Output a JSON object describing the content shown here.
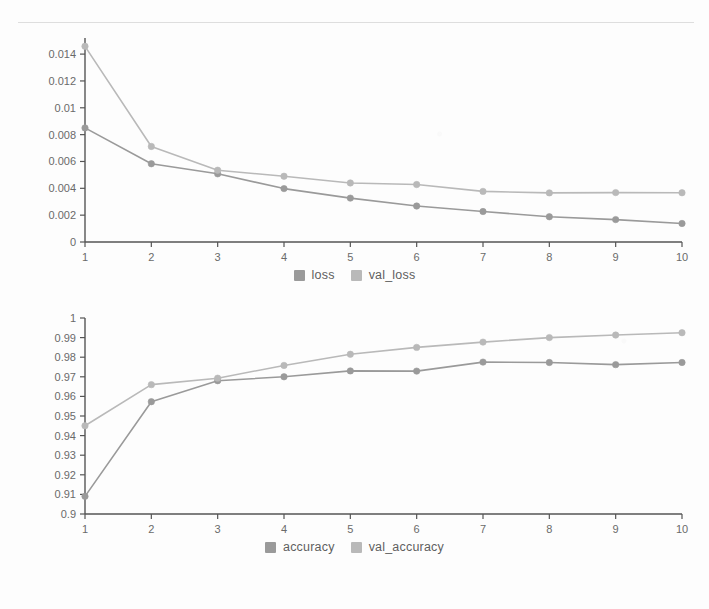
{
  "page": {
    "background_color": "#fdfdfd",
    "divider_color": "#dedede"
  },
  "colors": {
    "series_primary": "#9a9a9a",
    "series_secondary": "#b9b9b9",
    "axis": "#555555",
    "tick_label": "#6a6a6a",
    "legend_label": "#5f5f5f"
  },
  "chart_data": [
    {
      "type": "line",
      "id": "loss-chart",
      "title": "",
      "xlabel": "",
      "ylabel": "",
      "x": [
        1,
        2,
        3,
        4,
        5,
        6,
        7,
        8,
        9,
        10
      ],
      "xtick_labels": [
        "1",
        "2",
        "3",
        "4",
        "5",
        "6",
        "7",
        "8",
        "9",
        "10"
      ],
      "ytick_labels": [
        "0",
        "0.002",
        "0.004",
        "0.006",
        "0.008",
        "0.01",
        "0.012",
        "0.014"
      ],
      "ytick_values": [
        0,
        0.002,
        0.004,
        0.006,
        0.008,
        0.01,
        0.012,
        0.014
      ],
      "ylim": [
        0,
        0.0152
      ],
      "xlim": [
        1,
        10
      ],
      "grid": false,
      "legend_position": "bottom-center",
      "series": [
        {
          "name": "loss",
          "color": "#9a9a9a",
          "values": [
            0.0085,
            0.00583,
            0.00508,
            0.00398,
            0.00327,
            0.00268,
            0.00227,
            0.00188,
            0.00167,
            0.00138
          ]
        },
        {
          "name": "val_loss",
          "color": "#b9b9b9",
          "values": [
            0.01458,
            0.00712,
            0.00535,
            0.0049,
            0.0044,
            0.00428,
            0.00377,
            0.00366,
            0.00368,
            0.00367
          ]
        }
      ]
    },
    {
      "type": "line",
      "id": "accuracy-chart",
      "title": "",
      "xlabel": "",
      "ylabel": "",
      "x": [
        1,
        2,
        3,
        4,
        5,
        6,
        7,
        8,
        9,
        10
      ],
      "xtick_labels": [
        "1",
        "2",
        "3",
        "4",
        "5",
        "6",
        "7",
        "8",
        "9",
        "10"
      ],
      "ytick_labels": [
        "0.9",
        "0.91",
        "0.92",
        "0.93",
        "0.94",
        "0.95",
        "0.96",
        "0.97",
        "0.98",
        "0.99",
        "1"
      ],
      "ytick_values": [
        0.9,
        0.91,
        0.92,
        0.93,
        0.94,
        0.95,
        0.96,
        0.97,
        0.98,
        0.99,
        1
      ],
      "ylim": [
        0.9,
        1.0
      ],
      "xlim": [
        1,
        10
      ],
      "grid": false,
      "legend_position": "bottom-center",
      "series": [
        {
          "name": "accuracy",
          "color": "#9a9a9a",
          "values": [
            0.909,
            0.9573,
            0.968,
            0.97,
            0.973,
            0.9729,
            0.9775,
            0.9773,
            0.9762,
            0.9773
          ]
        },
        {
          "name": "val_accuracy",
          "color": "#b9b9b9",
          "values": [
            0.945,
            0.966,
            0.9693,
            0.9758,
            0.9815,
            0.985,
            0.9877,
            0.99,
            0.9913,
            0.9925
          ]
        }
      ]
    }
  ],
  "legends": {
    "loss": [
      {
        "label": "loss",
        "color": "#9a9a9a"
      },
      {
        "label": "val_loss",
        "color": "#b9b9b9"
      }
    ],
    "accuracy": [
      {
        "label": "accuracy",
        "color": "#9a9a9a"
      },
      {
        "label": "val_accuracy",
        "color": "#b9b9b9"
      }
    ]
  }
}
